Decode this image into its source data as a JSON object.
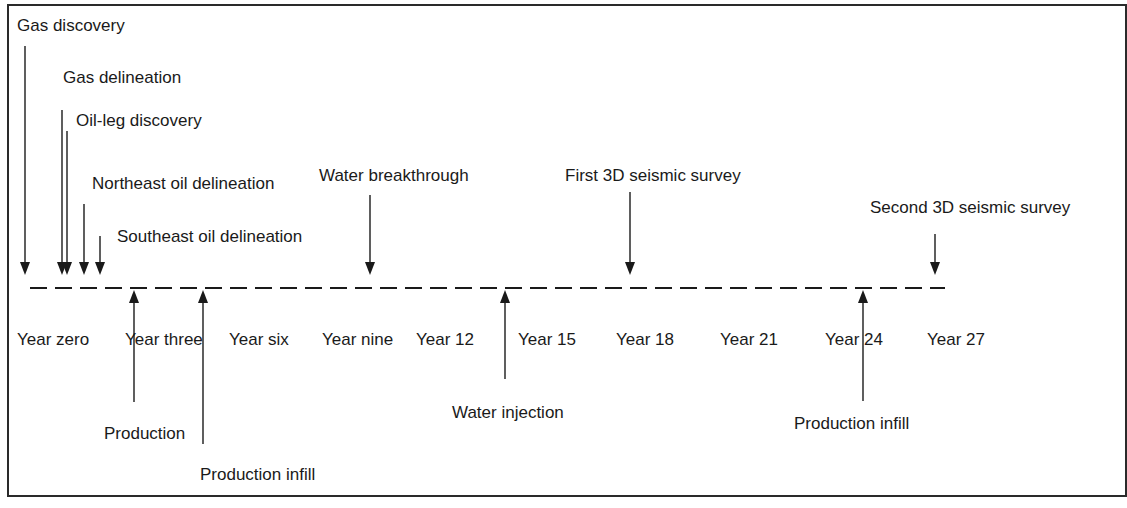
{
  "diagram": {
    "type": "timeline",
    "timeline": {
      "y": 288,
      "x_start": 30,
      "x_end": 945,
      "style": "dashed"
    },
    "year_labels": [
      {
        "text": "Year zero",
        "x": 17
      },
      {
        "text": "Year three",
        "x": 125
      },
      {
        "text": "Year six",
        "x": 229
      },
      {
        "text": "Year nine",
        "x": 322
      },
      {
        "text": "Year 12",
        "x": 416
      },
      {
        "text": "Year 15",
        "x": 518
      },
      {
        "text": "Year 18",
        "x": 616
      },
      {
        "text": "Year 21",
        "x": 720
      },
      {
        "text": "Year 24",
        "x": 825
      },
      {
        "text": "Year 27",
        "x": 927
      }
    ],
    "events_above": [
      {
        "text": "Gas discovery",
        "label_x": 17,
        "label_y": 17,
        "arrow_x": 25,
        "arrow_top": 46
      },
      {
        "text": "Gas delineation",
        "label_x": 63,
        "label_y": 69,
        "arrow_x": 62,
        "arrow_top": 110
      },
      {
        "text": "Oil-leg discovery",
        "label_x": 76,
        "label_y": 112,
        "arrow_x": 67,
        "arrow_top": 131
      },
      {
        "text": "Northeast oil delineation",
        "label_x": 92,
        "label_y": 175,
        "arrow_x": 84,
        "arrow_top": 204
      },
      {
        "text": "Southeast oil delineation",
        "label_x": 117,
        "label_y": 228,
        "arrow_x": 100,
        "arrow_top": 236
      },
      {
        "text": "Water breakthrough",
        "label_x": 319,
        "label_y": 167,
        "arrow_x": 370,
        "arrow_top": 195
      },
      {
        "text": "First 3D seismic survey",
        "label_x": 565,
        "label_y": 167,
        "arrow_x": 630,
        "arrow_top": 192
      },
      {
        "text": "Second 3D seismic survey",
        "label_x": 870,
        "label_y": 199,
        "arrow_x": 935,
        "arrow_top": 234
      }
    ],
    "events_below": [
      {
        "text": "Production",
        "label_x": 104,
        "label_y": 425,
        "arrow_x": 134,
        "arrow_bottom": 402
      },
      {
        "text": "Production infill",
        "label_x": 200,
        "label_y": 466,
        "arrow_x": 203,
        "arrow_bottom": 444
      },
      {
        "text": "Water injection",
        "label_x": 452,
        "label_y": 404,
        "arrow_x": 505,
        "arrow_bottom": 379
      },
      {
        "text": "Production infill",
        "label_x": 794,
        "label_y": 415,
        "arrow_x": 863,
        "arrow_bottom": 401
      }
    ],
    "colors": {
      "line": "#1a1a1a",
      "text": "#1a1a1a",
      "background": "#ffffff"
    }
  }
}
